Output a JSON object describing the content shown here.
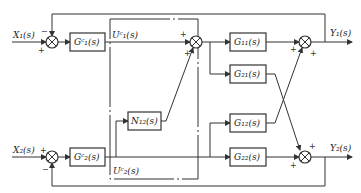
{
  "diagram": {
    "type": "block-diagram",
    "inputs": {
      "x1": "X₁(s)",
      "x2": "X₂(s)"
    },
    "outputs": {
      "y1": "Y₁(s)",
      "y2": "Y₂(s)"
    },
    "signals": {
      "uc1": "Uᶜ₁(s)",
      "uc2": "Uᶜ₂(s)"
    },
    "blocks": {
      "gc1": "Gᶜ₁(s)",
      "gc2": "Gᶜ₂(s)",
      "n12": "N₁₂(s)",
      "g11": "G₁₁(s)",
      "g21": "G₂₁(s)",
      "g12": "G₁₂(s)",
      "g22": "G₂₂(s)"
    },
    "signs": {
      "plus": "+",
      "minus": "−"
    }
  }
}
